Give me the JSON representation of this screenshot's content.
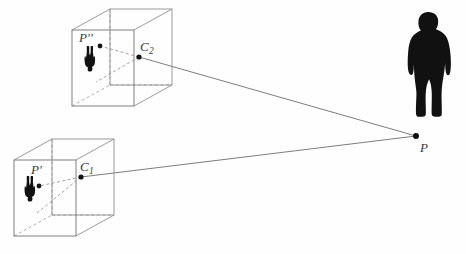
{
  "figure": {
    "background_color": "#fefefe",
    "line_color": "#6e6e6e",
    "silhouette_color": "#111111",
    "label_color": "#3a3a3a",
    "width": 466,
    "height": 254
  },
  "labels": {
    "image_point_upper": "P",
    "image_point_upper_prime": "′′",
    "image_point_lower": "P",
    "image_point_lower_prime": "′",
    "camera_center_upper": "C",
    "camera_center_upper_sub": "2",
    "camera_center_lower": "C",
    "camera_center_lower_sub": "1",
    "world_point": "P"
  },
  "points": {
    "world_point_P": {
      "x": 416,
      "y": 136
    },
    "camera_center_C2": {
      "x": 139,
      "y": 57
    },
    "camera_center_C1": {
      "x": 81,
      "y": 177
    },
    "image_point_Pdd": {
      "x": 100,
      "y": 46
    },
    "image_point_Pd": {
      "x": 39,
      "y": 186
    }
  },
  "boxes": {
    "upper": {
      "name": "camera-box-upper",
      "front_face": {
        "x": 72,
        "y": 30,
        "w": 62,
        "h": 76
      },
      "depth_dx": 38,
      "depth_dy": -21
    },
    "lower": {
      "name": "camera-box-lower",
      "front_face": {
        "x": 14,
        "y": 160,
        "w": 62,
        "h": 76
      },
      "depth_dx": 38,
      "depth_dy": -21
    }
  },
  "rays": [
    {
      "name": "ray-C2-to-P",
      "from": "camera_center_C2",
      "to": "world_point_P",
      "style": "solid"
    },
    {
      "name": "ray-C1-to-P",
      "from": "camera_center_C1",
      "to": "world_point_P",
      "style": "solid"
    },
    {
      "name": "ray-C2-to-Pdd",
      "from": "camera_center_C2",
      "to": "image_point_Pdd",
      "style": "dashed"
    },
    {
      "name": "ray-C1-to-Pd",
      "from": "camera_center_C1",
      "to": "image_point_Pd",
      "style": "dashed"
    }
  ]
}
